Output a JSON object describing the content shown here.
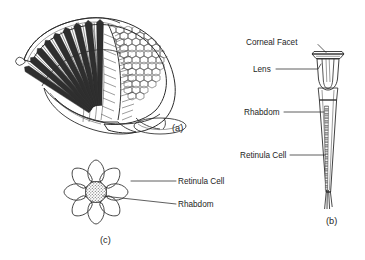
{
  "figure": {
    "title_visible": false,
    "background_color": "#ffffff",
    "ink_color": "#2b2b2b",
    "panels": [
      {
        "id": "a",
        "caption": "(a)",
        "description": "cutaway-compound-eye",
        "labels": []
      },
      {
        "id": "b",
        "caption": "(b)",
        "description": "single-ommatidium-longitudinal-section",
        "labels": [
          {
            "key": "corneal_facet",
            "text": "Corneal Facet"
          },
          {
            "key": "lens",
            "text": "Lens"
          },
          {
            "key": "rhabdom",
            "text": "Rhabdom"
          },
          {
            "key": "retinula_cell",
            "text": "Retinula Cell"
          }
        ]
      },
      {
        "id": "c",
        "caption": "(c)",
        "description": "ommatidium-transverse-section-rosette",
        "labels": [
          {
            "key": "retinula_cell",
            "text": "Retinula Cell"
          },
          {
            "key": "rhabdom",
            "text": "Rhabdom"
          }
        ]
      }
    ]
  },
  "labels": {
    "corneal_facet": "Corneal Facet",
    "lens": "Lens",
    "rhabdom": "Rhabdom",
    "retinula_cell": "Retinula Cell",
    "panel_a": "(a)",
    "panel_b": "(b)",
    "panel_c": "(c)"
  },
  "diagram_data": {
    "type": "scientific-illustration",
    "subject": "arthropod compound eye",
    "panel_a": {
      "view": "cutaway perspective",
      "ommatidia_in_fan": 17,
      "facet_surface": "hexagonal array",
      "hexagon_rows": 9
    },
    "panel_b": {
      "view": "longitudinal section",
      "parts_top_to_bottom": [
        "Corneal Facet",
        "Lens",
        "Rhabdom",
        "Retinula Cell"
      ],
      "axon_strands": 4
    },
    "panel_c": {
      "view": "transverse section",
      "retinula_cells": 8,
      "central_structure": "Rhabdom",
      "rhabdom_fill": "stippled"
    }
  }
}
